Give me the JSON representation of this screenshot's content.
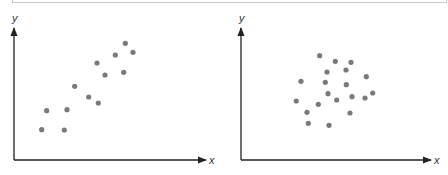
{
  "chart_data": [
    {
      "type": "scatter",
      "title": "",
      "xlabel": "x",
      "ylabel": "y",
      "grid": false,
      "legend": null,
      "description": "Positive linear correlation",
      "axes_px": {
        "origin": [
          14,
          160
        ],
        "x_end": 206,
        "y_end": 28
      },
      "points_px": [
        [
          41.7,
          129.7
        ],
        [
          46.7,
          110.7
        ],
        [
          64.3,
          130
        ],
        [
          67,
          109.7
        ],
        [
          74.7,
          86.3
        ],
        [
          88.7,
          97
        ],
        [
          98.3,
          103
        ],
        [
          97,
          63
        ],
        [
          105,
          75
        ],
        [
          115.3,
          55
        ],
        [
          123.7,
          72.3
        ],
        [
          125.3,
          43.3
        ],
        [
          133,
          52.3
        ]
      ]
    },
    {
      "type": "scatter",
      "title": "",
      "xlabel": "x",
      "ylabel": "y",
      "grid": false,
      "legend": null,
      "description": "No correlation (random cluster)",
      "axes_px": {
        "origin": [
          241,
          160
        ],
        "x_end": 431,
        "y_end": 28
      },
      "points_px": [
        [
          319.7,
          55.7
        ],
        [
          335.3,
          61.3
        ],
        [
          351,
          62.3
        ],
        [
          327,
          72
        ],
        [
          346,
          70
        ],
        [
          366.3,
          76.7
        ],
        [
          301,
          81.3
        ],
        [
          325.3,
          82.3
        ],
        [
          346.3,
          84.7
        ],
        [
          328,
          93.7
        ],
        [
          372.7,
          93
        ],
        [
          352,
          96.7
        ],
        [
          365,
          98
        ],
        [
          296.3,
          101
        ],
        [
          336.7,
          100
        ],
        [
          318.3,
          104.3
        ],
        [
          307,
          112.3
        ],
        [
          350,
          113
        ],
        [
          308.3,
          123.3
        ],
        [
          329,
          125.3
        ]
      ]
    }
  ],
  "style": {
    "axis_color": "#222222",
    "dot_color": "#7a7a7a",
    "dot_radius": 2.6
  }
}
